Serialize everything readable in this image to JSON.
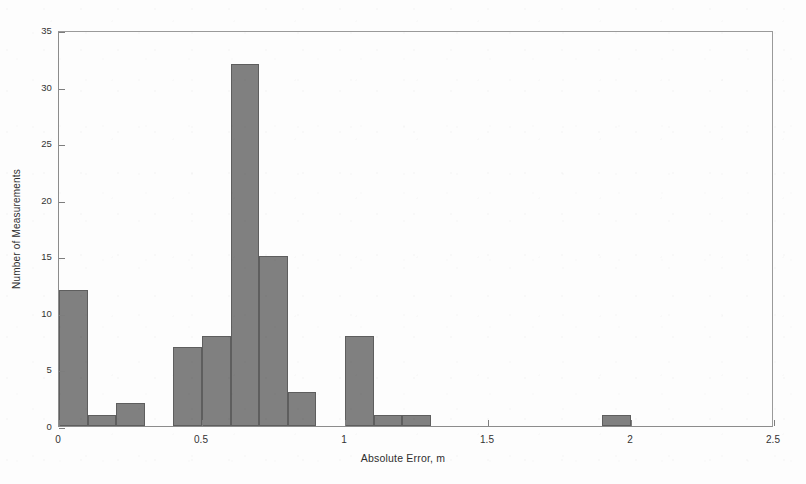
{
  "chart_data": {
    "type": "bar",
    "title": "",
    "subtitle": "",
    "xlabel": "Absolute Error, m",
    "ylabel": "Number of Measurements",
    "xlim": [
      0,
      2.5
    ],
    "ylim": [
      0,
      35
    ],
    "bin_width": 0.1,
    "grid": false,
    "legend": null,
    "xticks": [
      "0",
      "0.5",
      "1",
      "1.5",
      "2",
      "2.5"
    ],
    "xtick_values": [
      0,
      0.5,
      1,
      1.5,
      2,
      2.5
    ],
    "yticks": [
      "0",
      "5",
      "10",
      "15",
      "20",
      "25",
      "30",
      "35"
    ],
    "ytick_values": [
      0,
      5,
      10,
      15,
      20,
      25,
      30,
      35
    ],
    "bar_color": "#808080",
    "bar_edge_color": "#5e5e5e",
    "background_color": "#fdfdfd",
    "axis_color": "#8c8c8c",
    "bin_starts": [
      0.0,
      0.1,
      0.2,
      0.3,
      0.4,
      0.5,
      0.6,
      0.7,
      0.8,
      0.9,
      1.0,
      1.1,
      1.2,
      1.3,
      1.4,
      1.5,
      1.6,
      1.7,
      1.8,
      1.9,
      2.0,
      2.1,
      2.2,
      2.3,
      2.4
    ],
    "categories": [
      "0.0-0.1",
      "0.1-0.2",
      "0.2-0.3",
      "0.3-0.4",
      "0.4-0.5",
      "0.5-0.6",
      "0.6-0.7",
      "0.7-0.8",
      "0.8-0.9",
      "0.9-1.0",
      "1.0-1.1",
      "1.1-1.2",
      "1.2-1.3",
      "1.3-1.4",
      "1.4-1.5",
      "1.5-1.6",
      "1.6-1.7",
      "1.7-1.8",
      "1.8-1.9",
      "1.9-2.0",
      "2.0-2.1",
      "2.1-2.2",
      "2.2-2.3",
      "2.3-2.4",
      "2.4-2.5"
    ],
    "values": [
      12,
      1,
      2,
      0,
      7,
      8,
      32,
      15,
      3,
      0,
      8,
      1,
      1,
      0,
      0,
      0,
      0,
      0,
      0,
      1,
      0,
      0,
      0,
      0,
      0
    ],
    "total_measurements": 91
  }
}
